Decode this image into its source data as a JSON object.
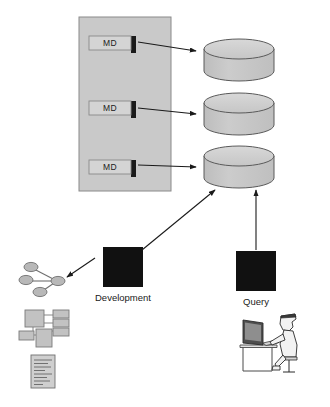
{
  "diagram": {
    "colors": {
      "panel_fill": "#c9c9c9",
      "panel_stroke": "#8a8a8a",
      "md_box_fill": "#d4d4d4",
      "md_box_stroke": "#8a8a8a",
      "md_box_shadow": "#1a1a1a",
      "cylinder_top_fill": "#d0d0d0",
      "cylinder_body_fill": "#c4c4c4",
      "cylinder_stroke": "#5a5a5a",
      "black_square": "#111111",
      "arrow": "#1a1a1a",
      "text": "#1a1a1a",
      "artifact_fill": "#c2c2c2",
      "artifact_stroke": "#7a7a7a",
      "background": "#ffffff"
    },
    "metadata_panel": {
      "name": "metadata-panel",
      "boxes": [
        {
          "label": "MD"
        },
        {
          "label": "MD"
        },
        {
          "label": "MD"
        }
      ]
    },
    "databases": [
      {
        "name": "database-cylinder-1"
      },
      {
        "name": "database-cylinder-2"
      },
      {
        "name": "database-cylinder-3"
      }
    ],
    "actors": [
      {
        "id": "development",
        "label": "Development"
      },
      {
        "id": "query",
        "label": "Query"
      }
    ],
    "artifacts": [
      {
        "id": "node-graph",
        "name": "node-graph-icon"
      },
      {
        "id": "entity-boxes",
        "name": "entity-boxes-icon"
      },
      {
        "id": "document",
        "name": "document-icon"
      },
      {
        "id": "user-at-computer",
        "name": "user-at-computer-icon"
      }
    ],
    "connections": [
      {
        "from": "md-box-1",
        "to": "database-cylinder-1"
      },
      {
        "from": "md-box-2",
        "to": "database-cylinder-2"
      },
      {
        "from": "md-box-3",
        "to": "database-cylinder-3"
      },
      {
        "from": "development",
        "to": "database-cylinder-3"
      },
      {
        "from": "query",
        "to": "database-cylinder-3"
      },
      {
        "from": "development",
        "to": "node-graph"
      }
    ]
  }
}
